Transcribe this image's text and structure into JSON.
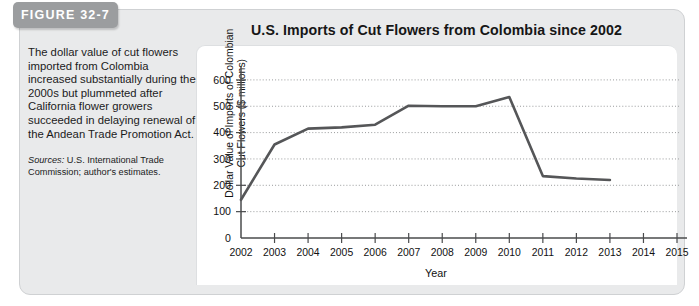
{
  "figure": {
    "tab_label": "FIGURE 32-7",
    "title": "U.S. Imports of Cut Flowers from Colombia since 2002",
    "description": "The dollar value of cut flowers imported from Colombia increased substantially during the 2000s but plummeted after California flower growers succeeded in delaying renewal of the Andean Trade Promotion Act.",
    "sources_label": "Sources:",
    "sources_text": " U.S. International Trade Commission; author's estimates."
  },
  "colors": {
    "tab_background": "#9b9d9f",
    "tab_text": "#ffffff",
    "panel_background": "#e9eaeb",
    "chart_background": "#ffffff",
    "line": "#555658",
    "axis": "#4a4b4d",
    "gridline": "#8d8f91"
  },
  "chart_data": {
    "type": "line",
    "title": "U.S. Imports of Cut Flowers from Colombia since 2002",
    "xlabel": "Year",
    "ylabel": "Dollar Value of Imports of Colombian Cut Flowers ($ millions)",
    "ylabel_line1": "Dollar Value of Imports of Colombian",
    "ylabel_line2": "Cut Flowers ($ millions)",
    "x": [
      2002,
      2003,
      2004,
      2005,
      2006,
      2007,
      2008,
      2009,
      2010,
      2011,
      2012,
      2013
    ],
    "values": [
      145,
      355,
      415,
      420,
      430,
      502,
      500,
      500,
      535,
      235,
      226,
      220
    ],
    "xticks": [
      "2002",
      "2003",
      "2004",
      "2005",
      "2006",
      "2007",
      "2008",
      "2009",
      "2010",
      "2011",
      "2012",
      "2013",
      "2014",
      "2015"
    ],
    "xlim": [
      2002,
      2015
    ],
    "yticks": [
      "0",
      "100",
      "200",
      "300",
      "400",
      "500",
      "600"
    ],
    "ytick_values": [
      0,
      100,
      200,
      300,
      400,
      500,
      600
    ],
    "ylim": [
      0,
      630
    ],
    "grid": true,
    "legend": false,
    "series": [
      {
        "name": "U.S. imports of Colombian cut flowers",
        "values": [
          145,
          355,
          415,
          420,
          430,
          502,
          500,
          500,
          535,
          235,
          226,
          220
        ]
      }
    ]
  }
}
